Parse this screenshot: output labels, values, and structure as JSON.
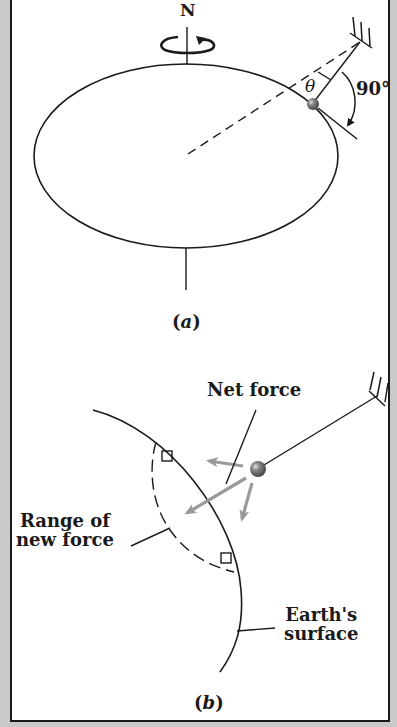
{
  "figure": {
    "panel_a": {
      "north_label": "N",
      "angle_label": "θ",
      "right_angle_label": "90°",
      "caption_open": "(",
      "caption_letter": "a",
      "caption_close": ")"
    },
    "panel_b": {
      "net_force_label": "Net force",
      "range_label_line1": "Range of",
      "range_label_line2": "new force",
      "surface_label_line1": "Earth's",
      "surface_label_line2": "surface",
      "caption_open": "(",
      "caption_letter": "b",
      "caption_close": ")"
    },
    "colors": {
      "ink": "#1a1a1a",
      "force_arrow": "#9a9a9a",
      "bob": "#6e6e6e",
      "background_strip": "#c9c9c9",
      "panel": "#ffffff"
    }
  }
}
